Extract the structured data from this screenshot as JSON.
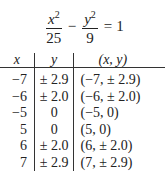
{
  "equation": {
    "term1": {
      "numerator_var": "x",
      "numerator_exp": "2",
      "denominator": "25"
    },
    "operator": "−",
    "term2": {
      "numerator_var": "y",
      "numerator_exp": "2",
      "denominator": "9"
    },
    "equals": "=",
    "rhs": "1"
  },
  "table": {
    "headers": {
      "x": "x",
      "y": "y",
      "point": "(x, y)"
    },
    "rows": [
      {
        "x": "−7",
        "y": "± 2.9",
        "point": "(−7, ± 2.9)"
      },
      {
        "x": "−6",
        "y": "± 2.0",
        "point": "(−6, ± 2.0)"
      },
      {
        "x": "−5",
        "y": "0",
        "point": "(−5, 0)"
      },
      {
        "x": "5",
        "y": "0",
        "point": "(5, 0)"
      },
      {
        "x": "6",
        "y": "± 2.0",
        "point": "(6, ± 2.0)"
      },
      {
        "x": "7",
        "y": "± 2.9",
        "point": "(7, ± 2.9)"
      }
    ]
  }
}
